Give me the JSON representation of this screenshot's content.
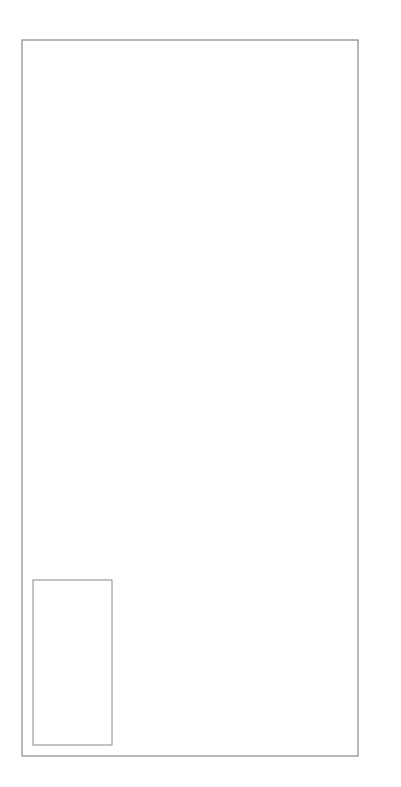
{
  "chart_data": {
    "type": "line",
    "orientation": "rotated-90-clockwise",
    "title": "",
    "series_name": "Close/USD",
    "xlabel": "",
    "ylabel": "",
    "ylim": [
      220,
      255
    ],
    "y_ticks": [
      255,
      250,
      245,
      240,
      235,
      230,
      225,
      220
    ],
    "x_tick_labels": [
      "14MAR86",
      "4APR",
      "25",
      "16MAY",
      "6JUN",
      "27",
      "18JUL",
      "8AUG",
      "29",
      "19SEP",
      "10OCT",
      "31",
      "21NOV"
    ],
    "grid": false,
    "legend_position": "lower-left (rotated)",
    "x": [
      "28FEB86",
      "7MAR86",
      "14MAR86",
      "21MAR86",
      "28MAR86",
      "4APR86",
      "11APR86",
      "18APR86",
      "25APR86",
      "2MAY86",
      "9MAY86",
      "16MAY86",
      "23MAY86",
      "30MAY86",
      "6JUN86",
      "13JUN86",
      "20JUN86",
      "27JUN86",
      "4JUL86",
      "11JUL86",
      "18JUL86",
      "25JUL86",
      "1AUG86",
      "8AUG86",
      "15AUG86",
      "22AUG86",
      "29AUG86",
      "5SEP86",
      "12SEP86",
      "19SEP86",
      "26SEP86",
      "3OCT86",
      "10OCT86",
      "17OCT86",
      "24OCT86",
      "31OCT86",
      "7NOV86",
      "14NOV86"
    ],
    "values": [
      226.7,
      225.57,
      236.45,
      233.2,
      238.9,
      228.55,
      235.85,
      242.3,
      242.2,
      234.5,
      237.6,
      232.5,
      241.2,
      247.1,
      245.6,
      245.6,
      247.5,
      249.5,
      251.8,
      242.2,
      236.3,
      240.1,
      234.8,
      236.9,
      247.1,
      250.2,
      252.93,
      250.5,
      230.6,
      232.1,
      232.1,
      233.6,
      235.4,
      238.6,
      238.26,
      243.96,
      245.8,
      244.5
    ],
    "stats": {
      "last": {
        "label": "Last",
        "value": "244.50",
        "date": "– 11/14/86"
      },
      "high": {
        "label": "High",
        "value": "252.93",
        "date": "– 8/29/86"
      },
      "avg": {
        "label": "Avg",
        "value": "239.79",
        "date": ""
      },
      "low": {
        "label": "Low",
        "value": "225.57",
        "date": "– 3/7/86"
      }
    }
  },
  "legend": {
    "title": "Close/USD",
    "rows": [
      {
        "label": "Last",
        "value": "244.50",
        "date": "– 11/14/86"
      },
      {
        "label": "High",
        "value": "252.93",
        "date": "– 8/29/86"
      },
      {
        "label": "Avg",
        "value": "239.79",
        "date": ""
      },
      {
        "label": "Low",
        "value": "225.57",
        "date": "– 3/7/86"
      }
    ]
  },
  "colors": {
    "line": "#333333",
    "frame": "#888888",
    "marker": "#222222",
    "text": "#444444"
  }
}
